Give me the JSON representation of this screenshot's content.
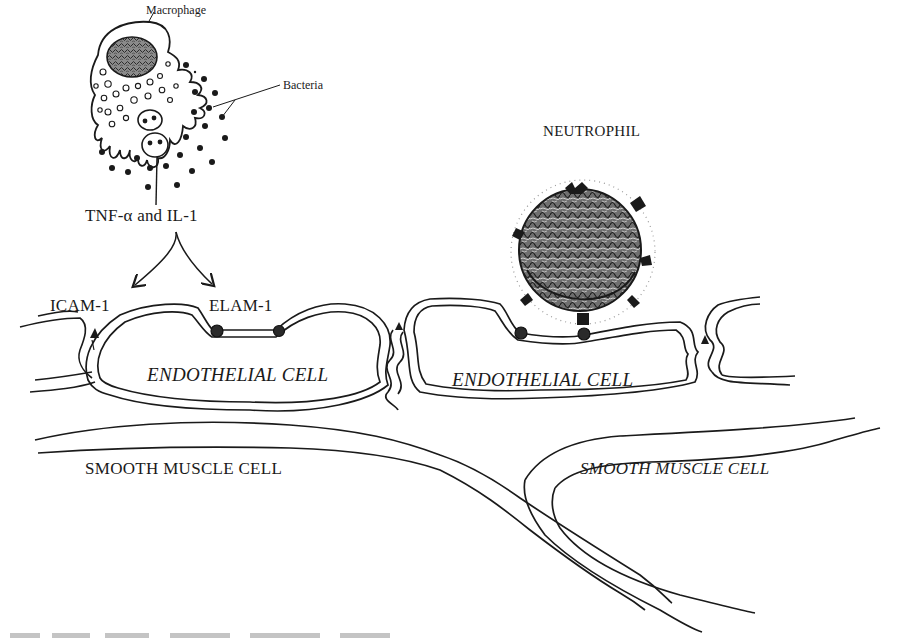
{
  "figure": {
    "labels": {
      "macrophage": "Macrophage",
      "bacteria": "Bacteria",
      "cytokines": "TNF-α and IL-1",
      "icam": "ICAM-1",
      "elam": "ELAM-1",
      "neutrophil": "NEUTROPHIL",
      "endothelial_left": "ENDOTHELIAL CELL",
      "endothelial_right": "ENDOTHELIAL CELL",
      "smooth_muscle_left": "SMOOTH MUSCLE CELL",
      "smooth_muscle_right": "SMOOTH MUSCLE CELL"
    },
    "colors": {
      "ink": "#1a1a1a",
      "background": "#ffffff"
    },
    "caption_visible": "cut off at bottom edge (illegible)"
  }
}
